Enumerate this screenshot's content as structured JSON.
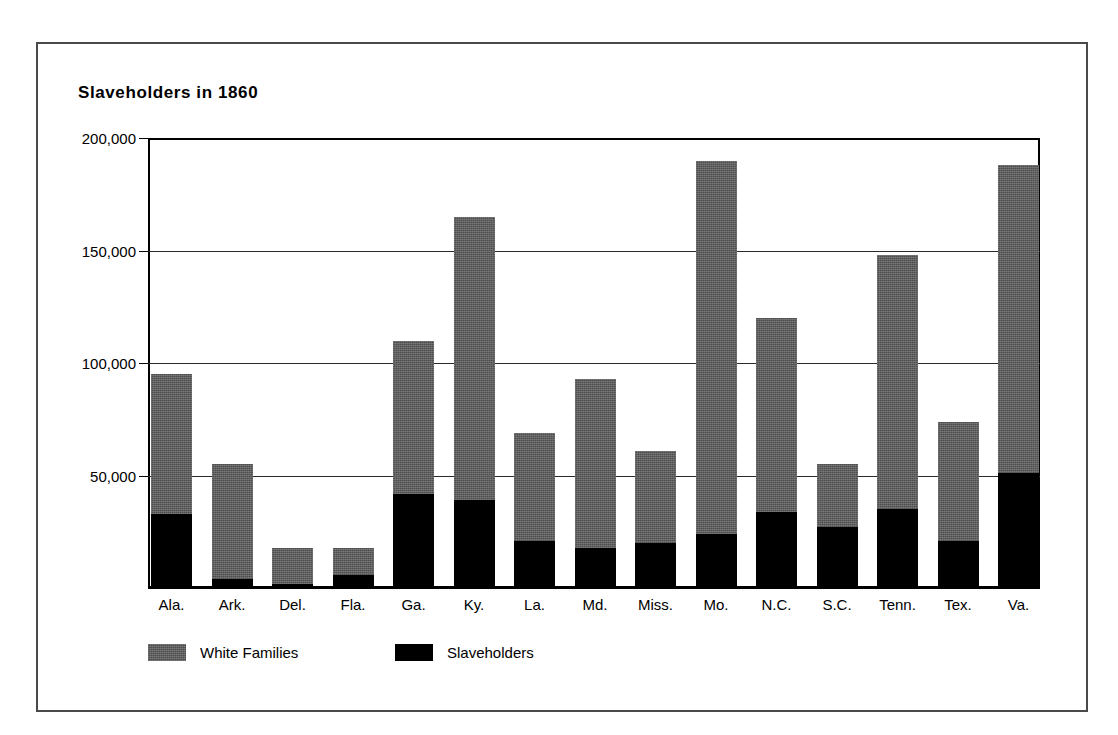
{
  "chart_data": {
    "type": "bar",
    "stacked": true,
    "title": "Slaveholders in 1860",
    "xlabel": "",
    "ylabel": "",
    "ylim": [
      0,
      200000
    ],
    "grid": true,
    "legend_position": "bottom-left",
    "categories": [
      "Ala.",
      "Ark.",
      "Del.",
      "Fla.",
      "Ga.",
      "Ky.",
      "La.",
      "Md.",
      "Miss.",
      "Mo.",
      "N.C.",
      "S.C.",
      "Tenn.",
      "Tex.",
      "Va."
    ],
    "ytick_labels": [
      "200,000",
      "150,000",
      "100,000",
      "50,000"
    ],
    "ytick_values": [
      200000,
      150000,
      100000,
      50000
    ],
    "series": [
      {
        "name": "White Families",
        "color": "#5e5e5e",
        "note": "total height of bar (white families), slaveholders stacked inside at base",
        "values": [
          95000,
          55000,
          18000,
          18000,
          110000,
          165000,
          69000,
          93000,
          61000,
          190000,
          120000,
          55000,
          148000,
          74000,
          188000
        ]
      },
      {
        "name": "Slaveholders",
        "color": "#000000",
        "values": [
          33000,
          4000,
          2000,
          6000,
          42000,
          39000,
          21000,
          18000,
          20000,
          24000,
          34000,
          27000,
          35000,
          21000,
          51000
        ]
      }
    ]
  },
  "legend": {
    "entries": [
      {
        "label": "White Families",
        "swatch": "gray"
      },
      {
        "label": "Slaveholders",
        "swatch": "black"
      }
    ]
  }
}
